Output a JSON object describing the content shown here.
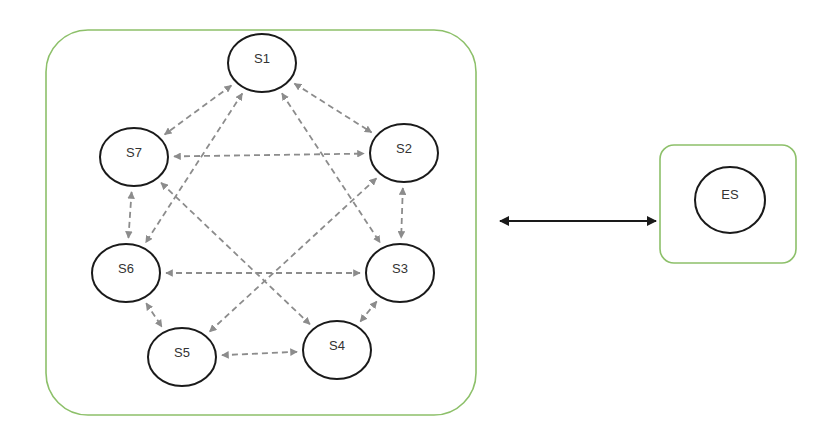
{
  "diagram": {
    "colors": {
      "container_border": "#8dc06a",
      "node_border": "#1a1a1a",
      "peer_link": "#8c8c8c",
      "external_link": "#1a1a1a"
    },
    "cluster": {
      "nodes": [
        {
          "id": "S1",
          "label": "S1"
        },
        {
          "id": "S2",
          "label": "S2"
        },
        {
          "id": "S3",
          "label": "S3"
        },
        {
          "id": "S4",
          "label": "S4"
        },
        {
          "id": "S5",
          "label": "S5"
        },
        {
          "id": "S6",
          "label": "S6"
        },
        {
          "id": "S7",
          "label": "S7"
        }
      ],
      "links": [
        {
          "from": "S1",
          "to": "S7",
          "style": "dashed",
          "direction": "both"
        },
        {
          "from": "S1",
          "to": "S2",
          "style": "dashed",
          "direction": "both"
        },
        {
          "from": "S7",
          "to": "S2",
          "style": "dashed",
          "direction": "both"
        },
        {
          "from": "S1",
          "to": "S6",
          "style": "dashed",
          "direction": "both"
        },
        {
          "from": "S1",
          "to": "S3",
          "style": "dashed",
          "direction": "both"
        },
        {
          "from": "S7",
          "to": "S6",
          "style": "dashed",
          "direction": "both"
        },
        {
          "from": "S7",
          "to": "S4",
          "style": "dashed",
          "direction": "both"
        },
        {
          "from": "S2",
          "to": "S3",
          "style": "dashed",
          "direction": "both"
        },
        {
          "from": "S2",
          "to": "S5",
          "style": "dashed",
          "direction": "both"
        },
        {
          "from": "S6",
          "to": "S3",
          "style": "dashed",
          "direction": "both"
        },
        {
          "from": "S6",
          "to": "S5",
          "style": "dashed",
          "direction": "both"
        },
        {
          "from": "S5",
          "to": "S4",
          "style": "dashed",
          "direction": "both"
        },
        {
          "from": "S4",
          "to": "S3",
          "style": "dashed",
          "direction": "both"
        }
      ]
    },
    "external": {
      "nodes": [
        {
          "id": "ES",
          "label": "ES"
        }
      ]
    },
    "external_link": {
      "from": "cluster",
      "to": "external",
      "style": "solid",
      "direction": "both"
    }
  }
}
